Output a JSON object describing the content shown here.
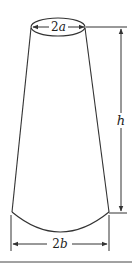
{
  "diagram": {
    "type": "truncated cone dimension figure",
    "labels": {
      "top_diameter": "2a",
      "height": "h",
      "bottom_diameter": "2b"
    },
    "colors": {
      "stroke": "#333333",
      "background": "#ffffff"
    }
  }
}
